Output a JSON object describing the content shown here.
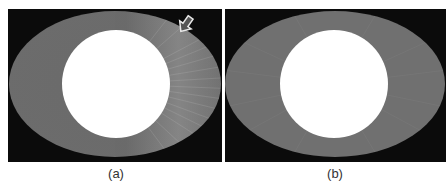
{
  "figure": {
    "panels": [
      {
        "label": "(a)",
        "description": "CT slice of elliptical phantom with bright circular insert; radial streak artifacts on right side",
        "annotation": "arrow-icon pointing to artifact region (upper right)",
        "colors": {
          "background": "#0b0b0b",
          "ellipse": "#6e6e6e",
          "insert": "#ffffff",
          "arrow_fill": "#555555",
          "arrow_stroke": "#e8e8e8"
        }
      },
      {
        "label": "(b)",
        "description": "CT slice of elliptical phantom with bright circular insert; artifacts corrected",
        "colors": {
          "background": "#0b0b0b",
          "ellipse": "#737373",
          "insert": "#ffffff"
        }
      }
    ]
  }
}
